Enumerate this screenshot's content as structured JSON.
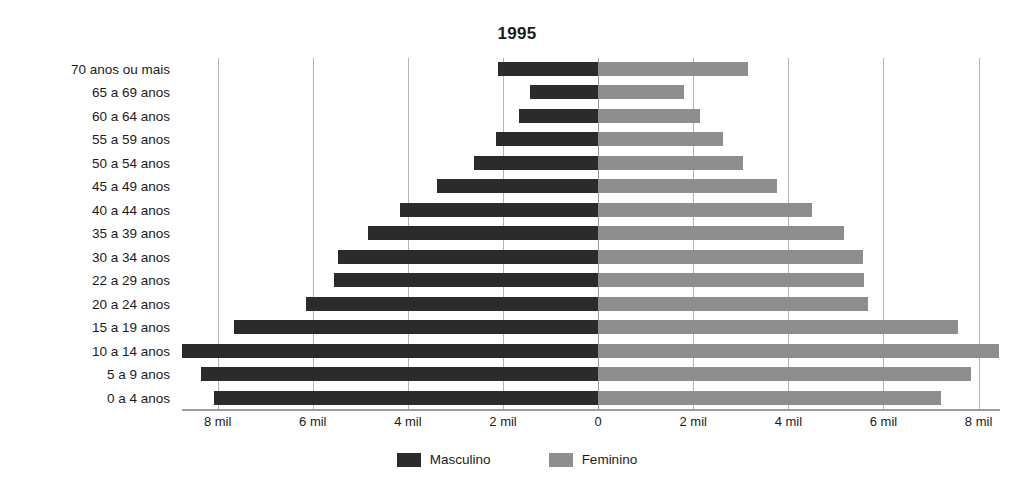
{
  "chart_data": {
    "type": "bar",
    "subtype": "population-pyramid",
    "title": "1995",
    "xlabel": "",
    "ylabel": "",
    "grid": true,
    "legend_position": "bottom-center",
    "orientation": "horizontal-diverging",
    "xlim": [
      -8750,
      8450
    ],
    "x_ticks": [
      -8000,
      -6000,
      -4000,
      -2000,
      0,
      2000,
      4000,
      6000,
      8000
    ],
    "x_tick_labels": [
      "8 mil",
      "6 mil",
      "4 mil",
      "2 mil",
      "0",
      "2 mil",
      "4 mil",
      "6 mil",
      "8 mil"
    ],
    "categories": [
      "70 anos ou mais",
      "65 a 69 anos",
      "60 a 64 anos",
      "55 a 59 anos",
      "50 a 54 anos",
      "45 a 49 anos",
      "40 a 44 anos",
      "35 a 39 anos",
      "30 a 34 anos",
      "22 a 29 anos",
      "20 a 24 anos",
      "15 a 19 anos",
      "10 a 14 anos",
      "5 a 9 anos",
      "0 a 4 anos"
    ],
    "series": [
      {
        "name": "Masculino",
        "color": "#2b2b2b",
        "side": "left",
        "values": [
          2110,
          1430,
          1660,
          2150,
          2610,
          3390,
          4170,
          4840,
          5470,
          5560,
          6150,
          7660,
          8740,
          8360,
          8080
        ]
      },
      {
        "name": "Feminino",
        "color": "#8e8e8e",
        "side": "right",
        "values": [
          3160,
          1810,
          2150,
          2630,
          3050,
          3770,
          4500,
          5160,
          5560,
          5600,
          5680,
          7560,
          8420,
          7850,
          7200
        ]
      }
    ]
  },
  "legend": {
    "items": [
      {
        "label": "Masculino",
        "color": "#2b2b2b",
        "swatch": "male"
      },
      {
        "label": "Feminino",
        "color": "#8e8e8e",
        "swatch": "female"
      }
    ]
  },
  "colors": {
    "male": "#2b2b2b",
    "female": "#8e8e8e",
    "gridline": "#b4b4b4",
    "axis": "#9d9d9d",
    "text": "#1b1b1b",
    "background": "#ffffff"
  }
}
